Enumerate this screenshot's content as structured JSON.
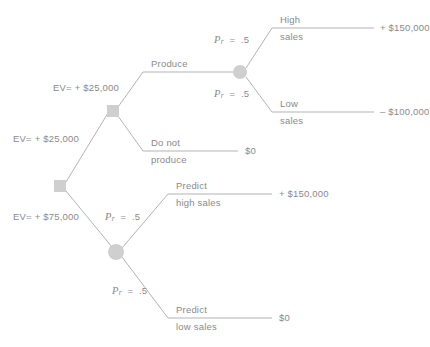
{
  "diagram": {
    "type": "decision-tree",
    "line_color": "#b0b0b0",
    "node_color": "#cccccc",
    "text_color": "#8a8a8a",
    "background": "#ffffff"
  },
  "nodes": {
    "root": {
      "name": "root-decision-node",
      "shape": "square",
      "x": 60,
      "y": 186
    },
    "produce_decision": {
      "name": "produce-decision-node",
      "shape": "square",
      "x": 113,
      "y": 111
    },
    "sales_chance": {
      "name": "sales-chance-node",
      "shape": "circle",
      "x": 240,
      "y": 72
    },
    "predict_chance": {
      "name": "predict-chance-node",
      "shape": "circle",
      "x": 116,
      "y": 252
    }
  },
  "ev_labels": {
    "upper_branch": "EV= + $25,000",
    "root_upper": "EV= + $25,000",
    "root_lower": "EV= + $75,000"
  },
  "probabilities": {
    "high_sales": "Pr = .5",
    "low_sales": "Pr = .5",
    "predict_high": "Pr = .5",
    "predict_low": "Pr = .5",
    "pr_symbol": "P",
    "pr_subscript": "r",
    "pr_equals": "=",
    "pr_value": ".5"
  },
  "branches": {
    "produce": {
      "label": "Produce",
      "label2": ""
    },
    "do_not_produce": {
      "label": "Do not",
      "label2": "produce",
      "payoff": "$0"
    },
    "high_sales": {
      "label": "High",
      "label2": "sales",
      "payoff": "+ $150,000"
    },
    "low_sales": {
      "label": "Low",
      "label2": "sales",
      "payoff": "– $100,000"
    },
    "predict_high_sales": {
      "label": "Predict",
      "label2": "high sales",
      "payoff": "+ $150,000"
    },
    "predict_low_sales": {
      "label": "Predict",
      "label2": "low  sales",
      "payoff": "$0"
    }
  }
}
